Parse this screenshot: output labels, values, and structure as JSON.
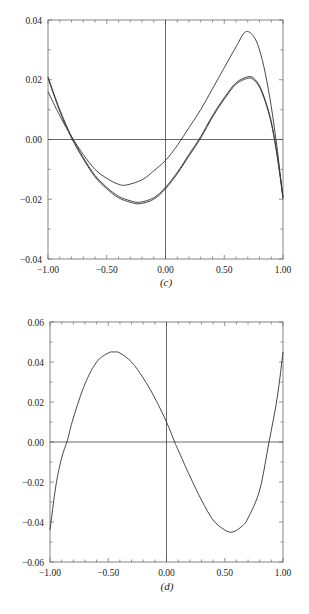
{
  "chart_data": [
    {
      "type": "line",
      "caption": "(c)",
      "title": "",
      "xlabel": "",
      "ylabel": "",
      "xlim": [
        -1.0,
        1.0
      ],
      "ylim": [
        -0.04,
        0.04
      ],
      "x_ticks": [
        "-1.00",
        "-0.50",
        "0.00",
        "0.50",
        "1.00"
      ],
      "y_ticks": [
        "0.04",
        "0.02",
        "0.00",
        "-0.02",
        "-0.04"
      ],
      "grid": false,
      "axes_cross_at_origin": true,
      "series": [
        {
          "name": "upper curve",
          "x": [
            -1.0,
            -0.9,
            -0.8,
            -0.7,
            -0.6,
            -0.5,
            -0.4,
            -0.33,
            -0.2,
            -0.1,
            0.0,
            0.1,
            0.2,
            0.3,
            0.4,
            0.5,
            0.6,
            0.68,
            0.75,
            0.8,
            0.85,
            0.9,
            0.95,
            1.0
          ],
          "y": [
            0.016,
            0.008,
            0.001,
            -0.005,
            -0.01,
            -0.013,
            -0.015,
            -0.0152,
            -0.0135,
            -0.0105,
            -0.007,
            -0.002,
            0.004,
            0.01,
            0.017,
            0.024,
            0.031,
            0.036,
            0.0345,
            0.03,
            0.022,
            0.011,
            -0.003,
            -0.02
          ]
        },
        {
          "name": "lower curve 1",
          "x": [
            -1.0,
            -0.9,
            -0.8,
            -0.7,
            -0.6,
            -0.5,
            -0.4,
            -0.3,
            -0.22,
            -0.1,
            0.0,
            0.1,
            0.2,
            0.3,
            0.4,
            0.5,
            0.6,
            0.7,
            0.75,
            0.8,
            0.85,
            0.9,
            0.95,
            1.0
          ],
          "y": [
            0.021,
            0.01,
            0.001,
            -0.006,
            -0.012,
            -0.016,
            -0.019,
            -0.0205,
            -0.021,
            -0.0195,
            -0.016,
            -0.011,
            -0.005,
            0.001,
            0.008,
            0.014,
            0.019,
            0.021,
            0.0205,
            0.018,
            0.013,
            0.006,
            -0.005,
            -0.019
          ]
        },
        {
          "name": "lower curve 2",
          "x": [
            -1.0,
            -0.9,
            -0.8,
            -0.7,
            -0.6,
            -0.5,
            -0.4,
            -0.3,
            -0.22,
            -0.1,
            0.0,
            0.1,
            0.2,
            0.3,
            0.4,
            0.5,
            0.6,
            0.7,
            0.75,
            0.8,
            0.85,
            0.9,
            0.95,
            1.0
          ],
          "y": [
            0.0205,
            0.0095,
            0.0005,
            -0.0065,
            -0.0125,
            -0.0165,
            -0.0195,
            -0.021,
            -0.0215,
            -0.02,
            -0.0165,
            -0.0115,
            -0.0055,
            0.0005,
            0.0075,
            0.0135,
            0.0185,
            0.0205,
            0.02,
            0.0175,
            0.0125,
            0.0055,
            -0.0055,
            -0.0195
          ]
        }
      ]
    },
    {
      "type": "line",
      "caption": "(d)",
      "title": "",
      "xlabel": "",
      "ylabel": "",
      "xlim": [
        -1.0,
        1.0
      ],
      "ylim": [
        -0.06,
        0.06
      ],
      "x_ticks": [
        "-1.00",
        "-0.50",
        "0.00",
        "0.50",
        "1.00"
      ],
      "y_ticks": [
        "0.06",
        "0.04",
        "0.02",
        "0.00",
        "-0.02",
        "-0.04",
        "-0.06"
      ],
      "grid": false,
      "axes_cross_at_origin": true,
      "series": [
        {
          "name": "curve",
          "x": [
            -1.0,
            -0.95,
            -0.9,
            -0.85,
            -0.8,
            -0.7,
            -0.6,
            -0.5,
            -0.45,
            -0.4,
            -0.3,
            -0.2,
            -0.1,
            0.0,
            0.07,
            0.1,
            0.2,
            0.3,
            0.4,
            0.5,
            0.57,
            0.65,
            0.7,
            0.8,
            0.88,
            0.95,
            1.0
          ],
          "y": [
            -0.044,
            -0.022,
            -0.008,
            0.001,
            0.012,
            0.029,
            0.04,
            0.0445,
            0.045,
            0.0445,
            0.04,
            0.032,
            0.022,
            0.01,
            0.0,
            -0.004,
            -0.017,
            -0.029,
            -0.039,
            -0.044,
            -0.045,
            -0.042,
            -0.038,
            -0.024,
            0.0,
            0.022,
            0.045
          ]
        }
      ]
    }
  ]
}
